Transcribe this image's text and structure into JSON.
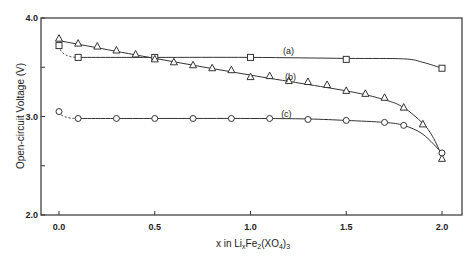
{
  "chart_data": {
    "type": "line",
    "title": "",
    "xlabel": "x in Li_xFe_2(XO_4)_3",
    "xlabel_parts": {
      "x": "x in Li",
      "sub1": "x",
      "fe": "Fe",
      "sub2": "2",
      "open": "(XO",
      "sub3": "4",
      "close": ")",
      "sub4": "3"
    },
    "ylabel": "Open-circuit Voltage (V)",
    "xlim": [
      -0.1,
      2.1
    ],
    "ylim": [
      2.0,
      4.0
    ],
    "x_ticks": [
      0.0,
      0.5,
      1.0,
      1.5,
      2.0
    ],
    "x_tick_labels": [
      "0.0",
      "0.5",
      "1.0",
      "1.5",
      "2.0"
    ],
    "y_ticks": [
      2.0,
      3.0,
      4.0
    ],
    "y_tick_labels": [
      "2.0",
      "3.0",
      "4.0"
    ],
    "y_minor_ticks": [
      2.5,
      3.5
    ],
    "grid": false,
    "legend": "inline labels",
    "series": [
      {
        "name": "(a)",
        "marker": "square",
        "initial_dashed": true,
        "label_pos": [
          1.17,
          3.63
        ],
        "x": [
          0.0,
          0.1,
          0.5,
          1.0,
          1.5,
          2.0
        ],
        "values": [
          3.72,
          3.6,
          3.6,
          3.6,
          3.58,
          3.49
        ],
        "curve_x": [
          0.0,
          0.1,
          0.5,
          1.0,
          1.5,
          1.8,
          1.9,
          2.0
        ],
        "curve_y": [
          3.72,
          3.6,
          3.6,
          3.6,
          3.59,
          3.585,
          3.55,
          3.49
        ]
      },
      {
        "name": "(b)",
        "marker": "triangle",
        "initial_dashed": false,
        "label_pos": [
          1.18,
          3.37
        ],
        "x": [
          0.0,
          0.1,
          0.2,
          0.3,
          0.4,
          0.5,
          0.6,
          0.7,
          0.8,
          0.9,
          1.0,
          1.1,
          1.2,
          1.3,
          1.4,
          1.5,
          1.6,
          1.7,
          1.8,
          1.9,
          2.0
        ],
        "values": [
          3.79,
          3.74,
          3.71,
          3.67,
          3.63,
          3.58,
          3.55,
          3.52,
          3.49,
          3.47,
          3.4,
          3.41,
          3.36,
          3.35,
          3.32,
          3.26,
          3.23,
          3.19,
          3.09,
          2.92,
          2.57
        ],
        "curve_x": [
          0.0,
          0.5,
          1.0,
          1.5,
          1.7,
          1.8,
          1.9,
          1.95,
          2.0
        ],
        "curve_y": [
          3.77,
          3.59,
          3.42,
          3.26,
          3.17,
          3.09,
          2.93,
          2.8,
          2.6
        ]
      },
      {
        "name": "(c)",
        "marker": "circle",
        "initial_dashed": true,
        "label_pos": [
          1.16,
          2.99
        ],
        "x": [
          0.0,
          0.1,
          0.3,
          0.5,
          0.7,
          0.9,
          1.1,
          1.3,
          1.5,
          1.7,
          1.8,
          2.0
        ],
        "values": [
          3.05,
          2.98,
          2.98,
          2.98,
          2.98,
          2.98,
          2.98,
          2.97,
          2.96,
          2.94,
          2.91,
          2.63
        ],
        "curve_x": [
          0.0,
          0.1,
          0.5,
          1.0,
          1.3,
          1.5,
          1.7,
          1.8,
          1.9,
          2.0
        ],
        "curve_y": [
          3.05,
          2.98,
          2.98,
          2.98,
          2.975,
          2.96,
          2.94,
          2.91,
          2.82,
          2.63
        ]
      }
    ]
  },
  "layout": {
    "plot": {
      "left": 41,
      "top": 18,
      "right": 462,
      "bottom": 215
    },
    "x0_px": 59,
    "x2_px": 442
  }
}
